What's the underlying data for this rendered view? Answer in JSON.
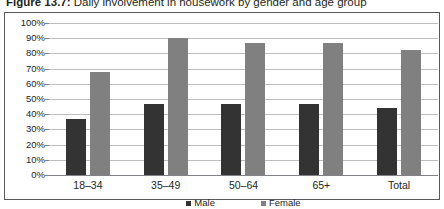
{
  "caption": {
    "number": "Figure 13.7:",
    "text": " Daily involvement in housework by gender and age group"
  },
  "colors": {
    "male": "#333333",
    "female": "#808080",
    "gridline": "#bcbec0",
    "axis": "#808285",
    "frame": "#58595b",
    "text": "#231f20"
  },
  "legend": {
    "items": [
      {
        "label": "Male",
        "series": "male"
      },
      {
        "label": "Female",
        "series": "female"
      }
    ]
  },
  "yaxis": {
    "ticks": [
      "100%",
      "90%",
      "80%",
      "70%",
      "60%",
      "50%",
      "40%",
      "30%",
      "20%",
      "10%",
      "0%"
    ]
  },
  "chart_data": {
    "type": "bar",
    "title": "Daily involvement in housework by gender and age group",
    "xlabel": "",
    "ylabel": "",
    "ylim": [
      0,
      100
    ],
    "ytick_interval": 10,
    "grid": true,
    "legend_position": "bottom",
    "categories": [
      "18–34",
      "35–49",
      "50–64",
      "65+",
      "Total"
    ],
    "series": [
      {
        "name": "Male",
        "color": "#333333",
        "values": [
          37,
          47,
          47,
          47,
          44
        ]
      },
      {
        "name": "Female",
        "color": "#808080",
        "values": [
          68,
          90,
          87,
          87,
          82
        ]
      }
    ]
  }
}
